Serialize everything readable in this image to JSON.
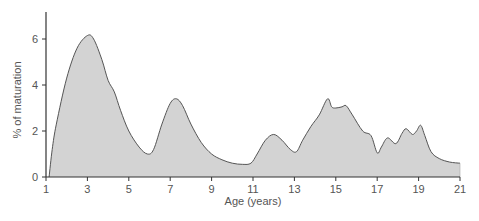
{
  "chart_data": {
    "type": "area",
    "title": "",
    "xlabel": "Age (years)",
    "ylabel": "% of maturation",
    "xlim": [
      1,
      21
    ],
    "ylim": [
      0,
      7
    ],
    "x_ticks": [
      1,
      3,
      5,
      7,
      9,
      11,
      13,
      15,
      17,
      19,
      21
    ],
    "y_ticks": [
      0,
      2,
      4,
      6
    ],
    "grid": false,
    "legend": null,
    "series": [
      {
        "name": "maturation",
        "x": [
          1.15,
          1.3,
          1.5,
          2.0,
          2.5,
          3.0,
          3.3,
          3.7,
          4.0,
          4.3,
          4.6,
          5.0,
          5.5,
          5.9,
          6.2,
          6.6,
          7.0,
          7.3,
          7.6,
          8.0,
          8.5,
          9.0,
          9.5,
          10.0,
          10.5,
          10.9,
          11.2,
          11.6,
          12.0,
          12.4,
          12.8,
          13.1,
          13.4,
          13.8,
          14.2,
          14.6,
          14.8,
          15.0,
          15.3,
          15.5,
          15.8,
          16.3,
          16.7,
          17.0,
          17.2,
          17.5,
          17.9,
          18.2,
          18.4,
          18.7,
          18.9,
          19.1,
          19.3,
          19.6,
          20.0,
          20.5,
          21.0
        ],
        "y": [
          0.0,
          1.2,
          2.3,
          4.3,
          5.6,
          6.15,
          6.0,
          5.1,
          4.2,
          3.7,
          2.9,
          2.0,
          1.3,
          1.0,
          1.2,
          2.3,
          3.2,
          3.4,
          3.1,
          2.3,
          1.5,
          1.0,
          0.75,
          0.6,
          0.55,
          0.6,
          1.0,
          1.6,
          1.85,
          1.6,
          1.2,
          1.1,
          1.6,
          2.2,
          2.7,
          3.4,
          3.05,
          3.0,
          3.05,
          3.1,
          2.7,
          2.0,
          1.8,
          1.05,
          1.3,
          1.7,
          1.45,
          1.9,
          2.1,
          1.85,
          2.0,
          2.25,
          1.8,
          1.1,
          0.8,
          0.65,
          0.6
        ]
      }
    ],
    "fill_color": "#d3d3d3",
    "line_color": "#555555"
  }
}
